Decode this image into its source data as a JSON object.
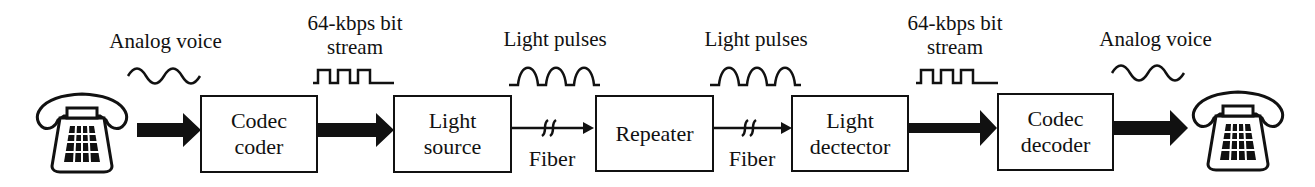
{
  "diagram": {
    "signals": [
      {
        "label": "Analog voice",
        "waveform": "sine"
      },
      {
        "label_line1": "64-kbps bit",
        "label_line2": "stream",
        "waveform": "square"
      },
      {
        "label": "Light pulses",
        "waveform": "pulses"
      },
      {
        "label": "Light pulses",
        "waveform": "pulses"
      },
      {
        "label_line1": "64-kbps bit",
        "label_line2": "stream",
        "waveform": "square"
      },
      {
        "label": "Analog voice",
        "waveform": "sine"
      }
    ],
    "blocks": [
      {
        "line1": "Codec",
        "line2": "coder"
      },
      {
        "line1": "Light",
        "line2": "source"
      },
      {
        "line1": "Repeater"
      },
      {
        "line1": "Light",
        "line2": "dectector"
      },
      {
        "line1": "Codec",
        "line2": "decoder"
      }
    ],
    "links": [
      {
        "label": "Fiber"
      },
      {
        "label": "Fiber"
      }
    ],
    "endpoints": [
      {
        "icon": "telephone-icon"
      },
      {
        "icon": "telephone-icon"
      }
    ]
  }
}
